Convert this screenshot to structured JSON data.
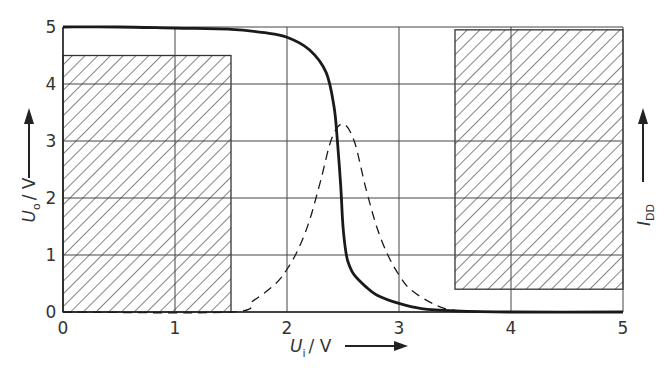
{
  "chart_data": {
    "type": "line",
    "title": "",
    "xlabel": "U_i / V",
    "xlabel_main": "U",
    "xlabel_sub": "i",
    "xlabel_unit": "/ V",
    "ylabel": "U_o / V",
    "ylabel_main": "U",
    "ylabel_sub": "o",
    "ylabel_unit": "/ V",
    "y2label": "I_DD",
    "y2label_main": "I",
    "y2label_sub": "DD",
    "xlim": [
      0,
      5
    ],
    "ylim": [
      0,
      5
    ],
    "xticks": [
      "0",
      "1",
      "2",
      "3",
      "4",
      "5"
    ],
    "yticks": [
      "0",
      "1",
      "2",
      "3",
      "4",
      "5"
    ],
    "grid": true,
    "legend": null,
    "series": [
      {
        "name": "U_o (transfer characteristic)",
        "style": "solid-thick",
        "x": [
          0,
          0.5,
          1.0,
          1.5,
          1.8,
          2.0,
          2.2,
          2.35,
          2.42,
          2.45,
          2.48,
          2.5,
          2.53,
          2.56,
          2.6,
          2.7,
          2.8,
          3.0,
          3.2,
          3.5,
          4.0,
          5.0
        ],
        "y": [
          5.0,
          5.0,
          4.98,
          4.96,
          4.9,
          4.82,
          4.6,
          4.2,
          3.6,
          3.0,
          2.2,
          1.5,
          1.0,
          0.8,
          0.65,
          0.45,
          0.3,
          0.15,
          0.06,
          0.02,
          0.0,
          0.0
        ]
      },
      {
        "name": "I_DD (supply current)",
        "style": "dashed",
        "x": [
          0,
          1.5,
          1.7,
          1.9,
          2.0,
          2.1,
          2.2,
          2.3,
          2.4,
          2.5,
          2.6,
          2.7,
          2.8,
          2.9,
          3.0,
          3.1,
          3.3,
          3.5,
          4.0,
          5.0
        ],
        "y": [
          0.0,
          0.0,
          0.2,
          0.5,
          0.75,
          1.1,
          1.6,
          2.3,
          3.05,
          3.3,
          3.0,
          2.2,
          1.5,
          1.0,
          0.65,
          0.4,
          0.15,
          0.03,
          0.0,
          0.0
        ]
      }
    ],
    "shaded_regions": [
      {
        "name": "forbidden-region-low-input",
        "x": [
          0,
          1.5
        ],
        "y": [
          0,
          4.5
        ],
        "pattern": "diagonal-hatch"
      },
      {
        "name": "forbidden-region-high-input",
        "x": [
          3.5,
          5.0
        ],
        "y": [
          0.4,
          4.95
        ],
        "pattern": "diagonal-hatch"
      }
    ],
    "colors": {
      "line": "#1a1a1a",
      "grid": "#444444",
      "hatch": "#333333",
      "background": "#ffffff"
    }
  }
}
